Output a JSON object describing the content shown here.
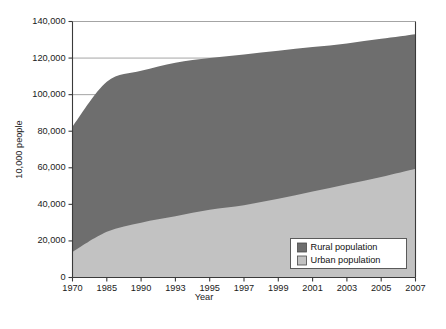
{
  "chart_data": {
    "type": "area",
    "stacked": true,
    "title": "",
    "xlabel": "Year",
    "ylabel": "10,000 people",
    "categories": [
      "1970",
      "1985",
      "1990",
      "1993",
      "1995",
      "1997",
      "1999",
      "2001",
      "2003",
      "2005",
      "2007"
    ],
    "x_tick_labels": [
      "1970",
      "1985",
      "1990",
      "1993",
      "1995",
      "1997",
      "1999",
      "2001",
      "2003",
      "2005",
      "2007"
    ],
    "y_tick_labels": [
      "0",
      "20,000",
      "40,000",
      "60,000",
      "80,000",
      "100,000",
      "120,000",
      "140,000"
    ],
    "y_tick_values": [
      0,
      20000,
      40000,
      60000,
      80000,
      100000,
      120000,
      140000
    ],
    "ylim": [
      0,
      140000
    ],
    "grid": "horizontal",
    "legend_position": "bottom-right-inside",
    "series": [
      {
        "name": "Urban population",
        "color": "#c2c2c2",
        "values": [
          14000,
          25000,
          30000,
          33500,
          37000,
          39500,
          43000,
          47000,
          51000,
          55000,
          59500
        ]
      },
      {
        "name": "Rural population",
        "color": "#6e6e6e",
        "values": [
          68500,
          82000,
          83000,
          84000,
          83000,
          82500,
          81000,
          79000,
          77000,
          75500,
          73500
        ]
      }
    ],
    "totals": [
      82500,
      107000,
      113000,
      117500,
      120000,
      122000,
      124000,
      126000,
      128000,
      130500,
      133000
    ]
  },
  "legend": {
    "entries": [
      {
        "label": "Rural population",
        "color": "#6e6e6e"
      },
      {
        "label": "Urban population",
        "color": "#c2c2c2"
      }
    ]
  },
  "axes": {
    "y_title": "10,000 people",
    "x_title": "Year"
  }
}
